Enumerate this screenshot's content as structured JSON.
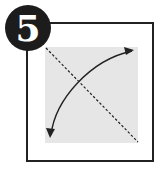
{
  "step": {
    "number": "5"
  },
  "diagram": {
    "paper_color": "#e6e6e6",
    "frame_color": "#222222",
    "fold_line": "dashed diagonal from top-left to bottom-right",
    "arrow": "curved double-headed arrow from bottom-left to top-right"
  },
  "caption": {
    "text": ""
  }
}
